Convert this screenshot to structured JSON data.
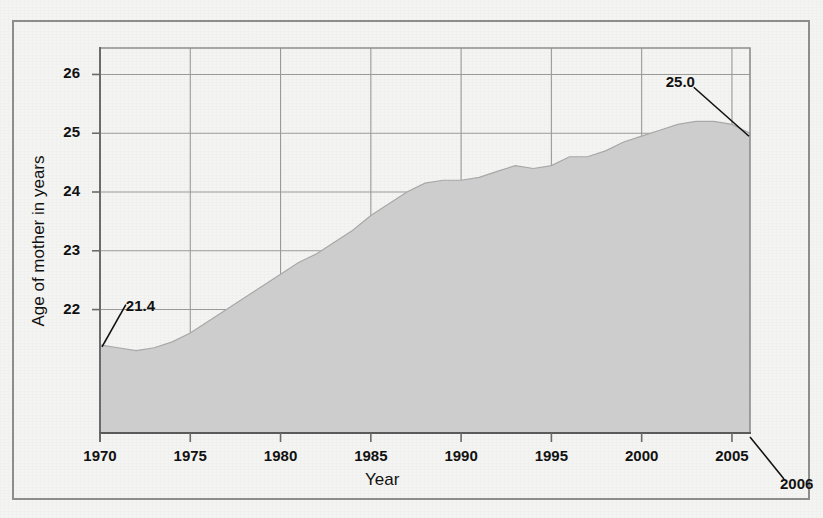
{
  "figure": {
    "cutoff_title": "",
    "xlabel": "Year",
    "ylabel": "Age of mother in years",
    "end_year_callout": "2006"
  },
  "colors": {
    "area_fill": "#cdcdcd",
    "area_stroke": "#a8a8a8",
    "grid": "#9a9a9a",
    "axis": "#6b6b6b",
    "frame": "#8d8d8d",
    "text": "#111111",
    "background": "#f4f4f2"
  },
  "chart_data": {
    "type": "area",
    "title": "",
    "xlabel": "Year",
    "ylabel": "Age of mother in years",
    "xlim": [
      1970,
      2006
    ],
    "ylim": [
      19.9,
      26.45
    ],
    "grid": true,
    "legend": null,
    "xticks": [
      1970,
      1975,
      1980,
      1985,
      1990,
      1995,
      2000,
      2005
    ],
    "xtick_labels": [
      "1970",
      "1975",
      "1980",
      "1985",
      "1990",
      "1995",
      "2000",
      "2005"
    ],
    "yticks": [
      22,
      23,
      24,
      25,
      26
    ],
    "ytick_labels": [
      "22",
      "23",
      "24",
      "25",
      "26"
    ],
    "annotations": [
      {
        "label": "21.4",
        "x": 1970,
        "y": 21.4,
        "text_x": 1971.1,
        "text_y": 22.05
      },
      {
        "label": "25.0",
        "x": 2006,
        "y": 25.0,
        "text_x": 2001.0,
        "text_y": 25.85
      }
    ],
    "x": [
      1970,
      1971,
      1972,
      1973,
      1974,
      1975,
      1976,
      1977,
      1978,
      1979,
      1980,
      1981,
      1982,
      1983,
      1984,
      1985,
      1986,
      1987,
      1988,
      1989,
      1990,
      1991,
      1992,
      1993,
      1994,
      1995,
      1996,
      1997,
      1998,
      1999,
      2000,
      2001,
      2002,
      2003,
      2004,
      2005,
      2006
    ],
    "values": [
      21.4,
      21.35,
      21.3,
      21.35,
      21.45,
      21.6,
      21.8,
      22.0,
      22.2,
      22.4,
      22.6,
      22.8,
      22.95,
      23.15,
      23.35,
      23.6,
      23.8,
      24.0,
      24.15,
      24.2,
      24.2,
      24.25,
      24.35,
      24.45,
      24.4,
      24.45,
      24.6,
      24.6,
      24.7,
      24.85,
      24.95,
      25.05,
      25.15,
      25.2,
      25.2,
      25.15,
      25.0
    ],
    "series_name": "Mean age of mother at first birth"
  }
}
